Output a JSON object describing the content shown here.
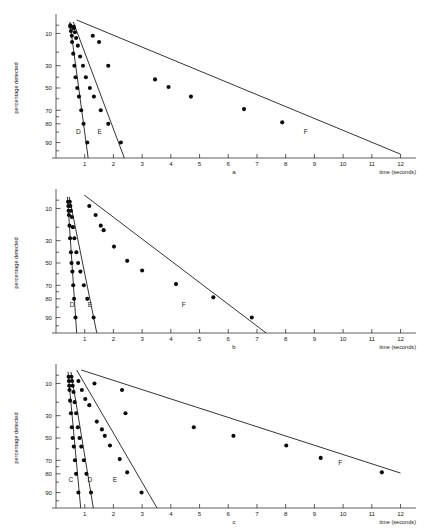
{
  "figure": {
    "y_axis_label": "percentage detected",
    "x_axis_label": "time (seconds)",
    "x_ticks": [
      "1",
      "2",
      "3",
      "4",
      "5",
      "6",
      "7",
      "8",
      "9",
      "10",
      "11",
      "12"
    ],
    "y_ticks": [
      "10",
      "30",
      "50",
      "70",
      "80",
      "90"
    ],
    "panel_labels": {
      "a": "a",
      "b": "b",
      "c": "c"
    },
    "caption": ""
  },
  "chart_data": [
    {
      "id": "a",
      "type": "scatter",
      "title": "a",
      "xlabel": "time (seconds)",
      "ylabel": "percentage detected",
      "xlim": [
        0,
        12.4
      ],
      "ylim_percent": [
        5,
        95
      ],
      "y_scale": "probit",
      "grid": false,
      "legend": "inline-curve-labels",
      "y_tick_values": [
        10,
        30,
        50,
        70,
        80,
        90
      ],
      "x_tick_values": [
        1,
        2,
        3,
        4,
        5,
        6,
        7,
        8,
        9,
        10,
        11,
        12
      ],
      "series": [
        {
          "name": "D",
          "label_x": 0.78,
          "label_percent": 86,
          "fit": [
            [
              0.48,
              6.0
            ],
            [
              1.12,
              95.0
            ]
          ],
          "points": [
            [
              0.5,
              7.5
            ],
            [
              0.52,
              9.0
            ],
            [
              0.55,
              11.0
            ],
            [
              0.56,
              14.0
            ],
            [
              0.6,
              21.0
            ],
            [
              0.64,
              30.0
            ],
            [
              0.68,
              40.0
            ],
            [
              0.74,
              50.0
            ],
            [
              0.8,
              58.0
            ],
            [
              0.88,
              70.0
            ],
            [
              0.96,
              80.0
            ],
            [
              1.09,
              90.0
            ]
          ]
        },
        {
          "name": "E",
          "label_x": 1.52,
          "label_percent": 86,
          "fit": [
            [
              0.6,
              6.0
            ],
            [
              2.38,
              95.0
            ]
          ],
          "points": [
            [
              0.62,
              7.5
            ],
            [
              0.66,
              9.5
            ],
            [
              0.7,
              12.0
            ],
            [
              0.76,
              16.0
            ],
            [
              0.84,
              23.0
            ],
            [
              0.94,
              30.0
            ],
            [
              1.04,
              40.0
            ],
            [
              1.18,
              50.0
            ],
            [
              1.32,
              58.0
            ],
            [
              1.56,
              70.0
            ],
            [
              1.82,
              80.0
            ],
            [
              2.26,
              90.0
            ]
          ]
        },
        {
          "name": "F",
          "label_x": 8.7,
          "label_percent": 86,
          "fit": [
            [
              0.72,
              5.5
            ],
            [
              12.0,
              94.0
            ]
          ],
          "points": [
            [
              0.5,
              7.0
            ],
            [
              0.62,
              8.0
            ],
            [
              1.28,
              11.0
            ],
            [
              1.5,
              14.0
            ],
            [
              1.82,
              30.0
            ],
            [
              3.45,
              42.0
            ],
            [
              3.92,
              49.0
            ],
            [
              4.7,
              58.0
            ],
            [
              6.55,
              69.0
            ],
            [
              7.88,
              79.0
            ]
          ]
        }
      ]
    },
    {
      "id": "b",
      "type": "scatter",
      "title": "b",
      "xlabel": "time (seconds)",
      "ylabel": "percentage detected",
      "xlim": [
        0,
        12.4
      ],
      "ylim_percent": [
        5,
        95
      ],
      "y_scale": "probit",
      "grid": false,
      "legend": "inline-curve-labels",
      "y_tick_values": [
        10,
        30,
        50,
        70,
        80,
        90
      ],
      "x_tick_values": [
        1,
        2,
        3,
        4,
        5,
        6,
        7,
        8,
        9,
        10,
        11,
        12
      ],
      "series": [
        {
          "name": "D",
          "label_x": 0.56,
          "label_percent": 85,
          "fit": [
            [
              0.4,
              6.0
            ],
            [
              0.72,
              95.0
            ]
          ],
          "points": [
            [
              0.42,
              7.5
            ],
            [
              0.43,
              9.0
            ],
            [
              0.44,
              11.0
            ],
            [
              0.45,
              13.0
            ],
            [
              0.47,
              19.0
            ],
            [
              0.49,
              28.0
            ],
            [
              0.52,
              40.0
            ],
            [
              0.54,
              50.0
            ],
            [
              0.57,
              58.0
            ],
            [
              0.6,
              70.0
            ],
            [
              0.63,
              80.0
            ],
            [
              0.68,
              90.0
            ]
          ]
        },
        {
          "name": "E",
          "label_x": 1.18,
          "label_percent": 85,
          "fit": [
            [
              0.46,
              6.0
            ],
            [
              1.42,
              95.0
            ]
          ],
          "points": [
            [
              0.48,
              7.5
            ],
            [
              0.5,
              9.0
            ],
            [
              0.52,
              11.0
            ],
            [
              0.55,
              14.0
            ],
            [
              0.59,
              20.0
            ],
            [
              0.64,
              28.0
            ],
            [
              0.71,
              40.0
            ],
            [
              0.77,
              50.0
            ],
            [
              0.85,
              58.0
            ],
            [
              0.97,
              70.0
            ],
            [
              1.09,
              80.0
            ],
            [
              1.31,
              90.0
            ]
          ]
        },
        {
          "name": "F",
          "label_x": 4.45,
          "label_percent": 85,
          "fit": [
            [
              0.98,
              5.5
            ],
            [
              7.32,
              95.0
            ]
          ],
          "points": [
            [
              1.16,
              9.0
            ],
            [
              1.38,
              13.0
            ],
            [
              1.56,
              19.0
            ],
            [
              1.66,
              22.0
            ],
            [
              2.02,
              35.0
            ],
            [
              2.48,
              48.0
            ],
            [
              3.0,
              57.0
            ],
            [
              4.18,
              69.0
            ],
            [
              5.48,
              79.0
            ],
            [
              6.82,
              90.0
            ]
          ]
        }
      ]
    },
    {
      "id": "c",
      "type": "scatter",
      "title": "c",
      "xlabel": "time (seconds)",
      "ylabel": "percentage detected",
      "xlim": [
        0,
        12.4
      ],
      "ylim_percent": [
        5,
        95
      ],
      "y_scale": "probit",
      "grid": false,
      "legend": "inline-curve-labels",
      "y_tick_values": [
        10,
        30,
        50,
        70,
        80,
        90
      ],
      "x_tick_values": [
        1,
        2,
        3,
        4,
        5,
        6,
        7,
        8,
        9,
        10,
        11,
        12
      ],
      "series": [
        {
          "name": "C",
          "label_x": 0.52,
          "label_percent": 85,
          "fit": [
            [
              0.42,
              6.0
            ],
            [
              0.86,
              95.0
            ]
          ],
          "points": [
            [
              0.44,
              7.5
            ],
            [
              0.45,
              9.0
            ],
            [
              0.46,
              11.0
            ],
            [
              0.47,
              13.0
            ],
            [
              0.49,
              19.0
            ],
            [
              0.52,
              28.0
            ],
            [
              0.55,
              40.0
            ],
            [
              0.58,
              50.0
            ],
            [
              0.62,
              58.0
            ],
            [
              0.66,
              70.0
            ],
            [
              0.7,
              80.0
            ],
            [
              0.78,
              90.0
            ]
          ]
        },
        {
          "name": "D",
          "label_x": 1.18,
          "label_percent": 85,
          "fit": [
            [
              0.52,
              6.0
            ],
            [
              1.3,
              95.0
            ]
          ],
          "points": [
            [
              0.54,
              7.5
            ],
            [
              0.56,
              9.0
            ],
            [
              0.58,
              11.0
            ],
            [
              0.61,
              14.0
            ],
            [
              0.65,
              20.0
            ],
            [
              0.7,
              28.0
            ],
            [
              0.76,
              40.0
            ],
            [
              0.82,
              50.0
            ],
            [
              0.88,
              58.0
            ],
            [
              0.97,
              70.0
            ],
            [
              1.06,
              80.0
            ],
            [
              1.22,
              90.0
            ]
          ]
        },
        {
          "name": "E",
          "label_x": 2.05,
          "label_percent": 85,
          "fit": [
            [
              0.72,
              5.5
            ],
            [
              3.52,
              95.0
            ]
          ],
          "points": [
            [
              0.78,
              9.0
            ],
            [
              0.9,
              13.0
            ],
            [
              1.02,
              18.0
            ],
            [
              1.16,
              22.0
            ],
            [
              1.42,
              35.0
            ],
            [
              1.6,
              42.0
            ],
            [
              1.7,
              48.0
            ],
            [
              1.88,
              57.0
            ],
            [
              2.22,
              69.0
            ],
            [
              2.48,
              79.0
            ],
            [
              2.98,
              90.0
            ]
          ]
        },
        {
          "name": "F",
          "label_x": 9.9,
          "label_percent": 74,
          "fit": [
            [
              0.88,
              5.5
            ],
            [
              12.0,
              79.5
            ]
          ],
          "points": [
            [
              1.34,
              10.0
            ],
            [
              2.3,
              13.0
            ],
            [
              2.42,
              28.0
            ],
            [
              4.8,
              40.0
            ],
            [
              6.18,
              48.0
            ],
            [
              8.02,
              57.0
            ],
            [
              9.22,
              68.0
            ],
            [
              11.35,
              79.0
            ]
          ]
        }
      ]
    }
  ]
}
